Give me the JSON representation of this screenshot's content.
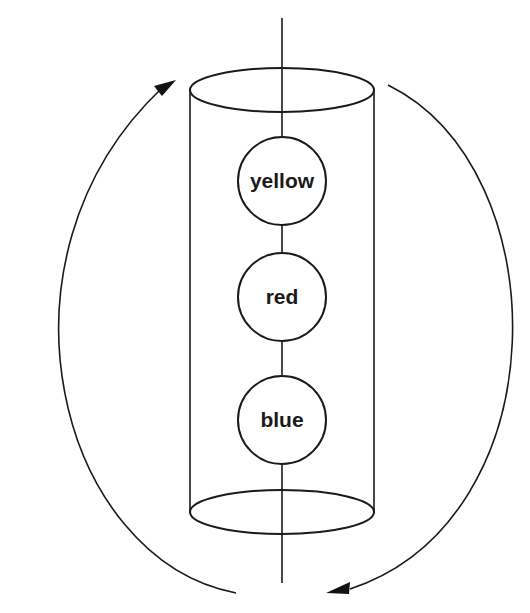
{
  "diagram": {
    "axis": {
      "x": 282,
      "y_top": 18,
      "y_bottom": 583
    },
    "cylinder": {
      "top_ellipse": {
        "cx": 282,
        "cy": 90,
        "rx": 92,
        "ry": 22
      },
      "bottom_ellipse": {
        "cx": 282,
        "cy": 512,
        "rx": 92,
        "ry": 22
      }
    },
    "nodes": [
      {
        "label": "yellow",
        "cx": 282,
        "cy": 181,
        "r": 44
      },
      {
        "label": "red",
        "cx": 282,
        "cy": 297,
        "r": 44
      },
      {
        "label": "blue",
        "cx": 282,
        "cy": 420,
        "r": 44
      }
    ],
    "arrows": [
      {
        "name": "left-rotation-arrow",
        "direction": "upward",
        "head_position": "top"
      },
      {
        "name": "right-rotation-arrow",
        "direction": "downward",
        "head_position": "bottom"
      }
    ],
    "colors": {
      "stroke": "#1a1a1a",
      "background": "#ffffff"
    }
  }
}
